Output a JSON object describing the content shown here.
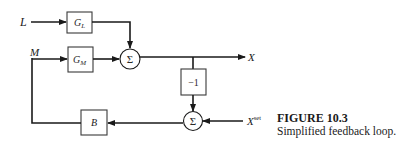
{
  "diagram": {
    "type": "block-diagram",
    "inputs": {
      "load": "L",
      "manipulated": "M",
      "setpoint_base": "X",
      "setpoint_sup": "set"
    },
    "output": "X",
    "blocks": {
      "g_l_base": "G",
      "g_l_sub": "L",
      "g_m_base": "G",
      "g_m_sub": "M",
      "neg": "−1",
      "b": "B"
    },
    "summers": {
      "sum1": "Σ",
      "sum2": "Σ"
    },
    "colors": {
      "line": "#1a1a1a",
      "box_border": "#3a3a3a",
      "background": "#ffffff"
    }
  },
  "caption": {
    "title": "FIGURE 10.3",
    "text": "Simplified feedback loop."
  }
}
